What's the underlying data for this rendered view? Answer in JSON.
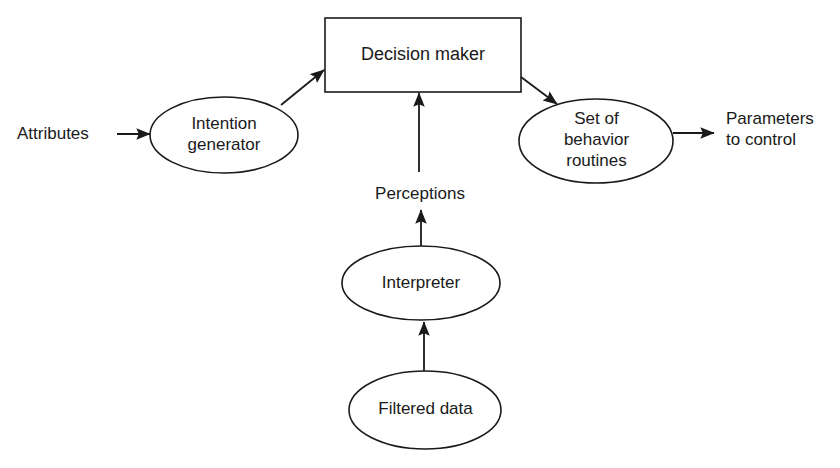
{
  "diagram": {
    "stroke_color": "#1a1a1a",
    "fill_color": "#ffffff",
    "background_color": "#ffffff",
    "nodes": [
      {
        "id": "decision-maker",
        "shape": "rectangle",
        "label": "Decision maker"
      },
      {
        "id": "intention-generator",
        "shape": "ellipse",
        "label": "Intention\ngenerator"
      },
      {
        "id": "behavior-routines",
        "shape": "ellipse",
        "label": "Set of\nbehavior\nroutines"
      },
      {
        "id": "interpreter",
        "shape": "ellipse",
        "label": "Interpreter"
      },
      {
        "id": "filtered-data",
        "shape": "ellipse",
        "label": "Filtered data"
      }
    ],
    "edge_labels": [
      {
        "id": "perceptions",
        "label": "Perceptions"
      }
    ],
    "io_labels": [
      {
        "id": "attributes",
        "label": "Attributes"
      },
      {
        "id": "parameters",
        "label": "Parameters\nto control"
      }
    ],
    "edges": [
      {
        "from": "attributes",
        "to": "intention-generator"
      },
      {
        "from": "intention-generator",
        "to": "decision-maker"
      },
      {
        "from": "interpreter",
        "to": "decision-maker"
      },
      {
        "from": "decision-maker",
        "to": "behavior-routines"
      },
      {
        "from": "behavior-routines",
        "to": "parameters"
      },
      {
        "from": "filtered-data",
        "to": "interpreter"
      }
    ]
  }
}
